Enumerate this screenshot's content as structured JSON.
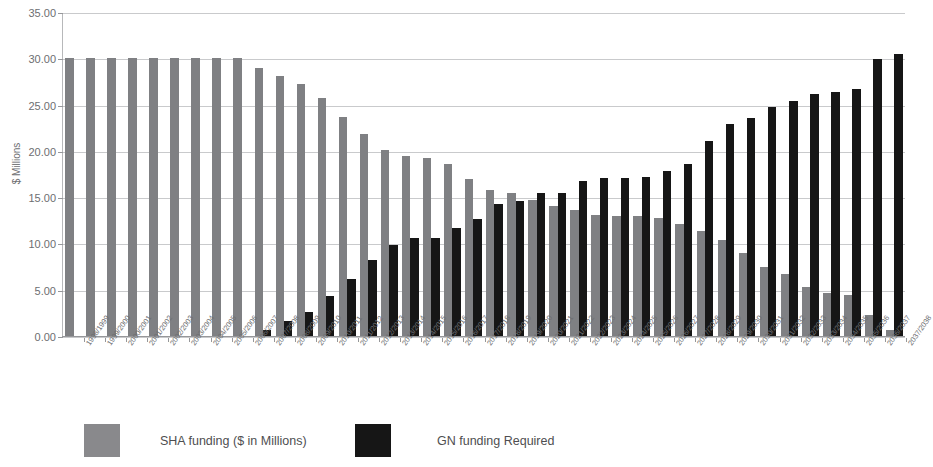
{
  "chart_data": {
    "type": "bar",
    "title": "",
    "xlabel": "",
    "ylabel": "$ Millions",
    "ylim": [
      0,
      35
    ],
    "ytick_step": 5,
    "ytick_labels": [
      "0.00",
      "5.00",
      "10.00",
      "15.00",
      "20.00",
      "25.00",
      "30.00",
      "35.00"
    ],
    "grid": true,
    "legend_position": "bottom",
    "colors": {
      "sha": "#7f8083",
      "gn": "#161616",
      "gridline": "#c9cacc",
      "axis": "#96979a",
      "text": "#6d6e71"
    },
    "categories": [
      "1998/1999",
      "1999/2000",
      "2000/2001",
      "2001/2002",
      "2002/2003",
      "2003/2004",
      "2004/2005",
      "2005/2006",
      "2006/2007",
      "2007/2008",
      "2008/2009",
      "2009/2010",
      "2010/2011",
      "2011/2012",
      "2012/2013",
      "2013/2014",
      "2014/2015",
      "2015/2016",
      "2016/2017",
      "2017/2018",
      "2018/2019",
      "2019/2020",
      "2020/2021",
      "2021/2022",
      "2022/2023",
      "2023/2024",
      "2024/2025",
      "2025/2026",
      "2026/2027",
      "2027/2028",
      "2028/2029",
      "2029/2030",
      "2030/2031",
      "2031/2032",
      "2032/2033",
      "2033/2034",
      "2034/2035",
      "2035/2036",
      "2036/2037",
      "2037/2038"
    ],
    "series": [
      {
        "name": "SHA funding ($ in Millions)",
        "color": "#7f8083",
        "values": [
          30.0,
          30.0,
          30.0,
          30.0,
          30.0,
          30.0,
          30.0,
          30.0,
          30.0,
          29.0,
          28.1,
          27.2,
          25.7,
          23.7,
          21.8,
          20.1,
          19.5,
          19.2,
          18.6,
          17.0,
          15.8,
          15.4,
          14.7,
          14.0,
          13.6,
          13.1,
          13.0,
          13.0,
          12.7,
          12.1,
          11.3,
          10.4,
          9.0,
          7.5,
          6.7,
          5.3,
          4.7,
          4.4,
          2.3,
          0.7
        ]
      },
      {
        "name": "GN funding Required",
        "color": "#161616",
        "values": [
          0.0,
          0.0,
          0.0,
          0.0,
          0.0,
          0.0,
          0.0,
          0.0,
          0.0,
          0.6,
          1.6,
          2.6,
          4.3,
          6.2,
          8.2,
          9.8,
          10.6,
          10.6,
          11.7,
          12.6,
          14.3,
          14.6,
          15.4,
          15.5,
          16.7,
          17.1,
          17.1,
          17.2,
          17.8,
          18.6,
          21.1,
          22.9,
          23.6,
          24.7,
          25.4,
          26.1,
          26.4,
          26.7,
          29.9,
          30.5
        ]
      }
    ]
  },
  "legend": {
    "items": [
      {
        "label": "SHA funding ($ in Millions)"
      },
      {
        "label": "GN funding Required"
      }
    ]
  }
}
